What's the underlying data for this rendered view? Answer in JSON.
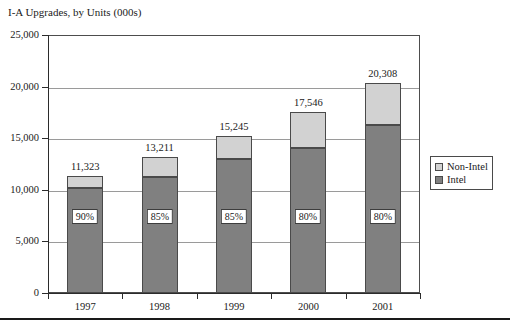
{
  "chart_data": {
    "type": "bar",
    "subtype": "stacked-column",
    "title": "I-A Upgrades, by Units (000s)",
    "xlabel": "",
    "ylabel": "",
    "categories": [
      "1997",
      "1998",
      "1999",
      "2000",
      "2001"
    ],
    "ylim": [
      0,
      25000
    ],
    "ytick_labels": [
      "0",
      "5,000",
      "10,000",
      "15,000",
      "20,000",
      "25,000"
    ],
    "ytick_values": [
      0,
      5000,
      10000,
      15000,
      20000,
      25000
    ],
    "grid": true,
    "legend_position": "right-outside",
    "series": [
      {
        "name": "Intel",
        "color": "#808080",
        "values": [
          10191,
          11229,
          12958,
          14037,
          16246
        ],
        "share_labels": [
          "90%",
          "85%",
          "85%",
          "80%",
          "80%"
        ]
      },
      {
        "name": "Non-Intel",
        "color": "#d2d2d2",
        "values": [
          1132,
          1982,
          2287,
          3509,
          4062
        ]
      }
    ],
    "totals": [
      11323,
      13211,
      15245,
      17546,
      20308
    ],
    "total_labels": [
      "11,323",
      "13,211",
      "15,245",
      "17,546",
      "20,308"
    ]
  },
  "legend": {
    "items": [
      {
        "label": "Non-Intel",
        "color": "#d2d2d2"
      },
      {
        "label": "Intel",
        "color": "#808080"
      }
    ]
  }
}
